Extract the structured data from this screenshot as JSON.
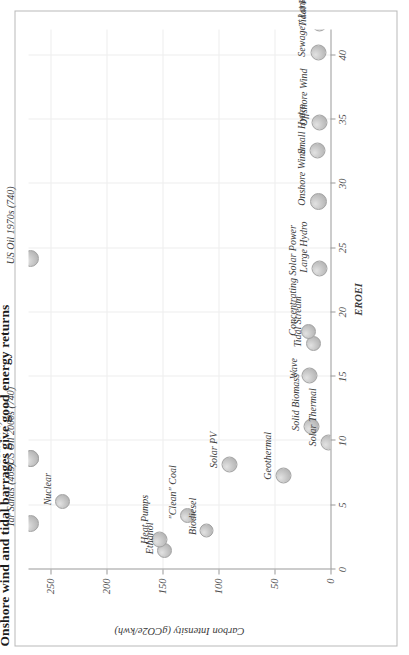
{
  "figure": {
    "title": "Onshore wind and tidal barrages give good energy returns"
  },
  "chart_data": {
    "type": "scatter",
    "title": "Onshore wind and tidal barrages give good energy returns",
    "xlabel": "EROEI",
    "ylabel": "Carbon Intensity (gCO2e/kwh)",
    "xlim": [
      0,
      42
    ],
    "ylim": [
      0,
      270
    ],
    "xticks": [
      0,
      5,
      10,
      15,
      20,
      25,
      30,
      35,
      40
    ],
    "xticklabels": [
      "0",
      "5",
      "10",
      "15",
      "20",
      "25",
      "30",
      "35",
      "40"
    ],
    "yticks": [
      0,
      50,
      100,
      150,
      200,
      250
    ],
    "yticklabels": [
      "0",
      "50",
      "100",
      "150",
      "200",
      "250"
    ],
    "grid": true,
    "legend": "none",
    "points": [
      {
        "label": "Tar Sands (465)",
        "x": 3.6,
        "y": 465,
        "y_clipped": 268,
        "size": 17,
        "label_dx": -4,
        "label_dy": -26,
        "label_rot": 0
      },
      {
        "label": "Coal (974)",
        "x": 8.6,
        "y": 974,
        "y_clipped": 268,
        "size": 17,
        "label_dx": -6,
        "label_dy": -40,
        "label_rot": 0
      },
      {
        "label": "US Oil 2000s (740)",
        "x": 8.6,
        "y": 740,
        "y_clipped": 268,
        "size": 17,
        "label_dx": -6,
        "label_dy": -26,
        "label_rot": 0
      },
      {
        "label": "US Oil 1970s (740)",
        "x": 24.2,
        "y": 740,
        "y_clipped": 268,
        "size": 17,
        "label_dx": -6,
        "label_dy": -26,
        "label_rot": 0
      },
      {
        "label": "Nuclear",
        "x": 5.3,
        "y": 240,
        "size": 15,
        "label_dx": -4,
        "label_dy": -21,
        "label_rot": 0
      },
      {
        "label": "Ethanol",
        "x": 1.5,
        "y": 148,
        "size": 15,
        "label_dx": -4,
        "label_dy": -21,
        "label_rot": 0
      },
      {
        "label": "Heat Pumps",
        "x": 2.3,
        "y": 153,
        "size": 16,
        "label_dx": -4,
        "label_dy": -21,
        "label_rot": 0
      },
      {
        "label": "\"Clean\" Coal",
        "x": 4.2,
        "y": 128,
        "size": 15,
        "label_dx": -4,
        "label_dy": -21,
        "label_rot": 0
      },
      {
        "label": "Biodiesel",
        "x": 3.0,
        "y": 111,
        "size": 14,
        "label_dx": -4,
        "label_dy": -20,
        "label_rot": 0
      },
      {
        "label": "Solar PV",
        "x": 8.2,
        "y": 90,
        "size": 16,
        "label_dx": -4,
        "label_dy": -22,
        "label_rot": 0
      },
      {
        "label": "Geothermal",
        "x": 7.3,
        "y": 42,
        "size": 16,
        "label_dx": -4,
        "label_dy": -22,
        "label_rot": 0
      },
      {
        "label": "Solid Biomass",
        "x": 11.1,
        "y": 17,
        "size": 16,
        "label_dx": -4,
        "label_dy": -22,
        "label_rot": 0
      },
      {
        "label": "Solar Thermal",
        "x": 9.9,
        "y": 2,
        "size": 16,
        "label_dx": -4,
        "label_dy": -22,
        "label_rot": 0
      },
      {
        "label": "Wave",
        "x": 15.1,
        "y": 19,
        "size": 16,
        "label_dx": -4,
        "label_dy": -22,
        "label_rot": 0
      },
      {
        "label": "Tidal Stream",
        "x": 17.6,
        "y": 15,
        "size": 15,
        "label_dx": -4,
        "label_dy": -22,
        "label_rot": 0
      },
      {
        "label": "Concentrating Solar Power",
        "x": 18.5,
        "y": 20,
        "size": 15,
        "label_dx": -4,
        "label_dy": -22,
        "label_rot": 0
      },
      {
        "label": "Large Hydro",
        "x": 23.4,
        "y": 10,
        "size": 16,
        "label_dx": -4,
        "label_dy": -22,
        "label_rot": 0
      },
      {
        "label": "Onshore Wind",
        "x": 28.6,
        "y": 11,
        "size": 17,
        "label_dx": -4,
        "label_dy": -23,
        "label_rot": 0
      },
      {
        "label": "Small Hydro",
        "x": 32.6,
        "y": 12,
        "size": 16,
        "label_dx": -4,
        "label_dy": -22,
        "label_rot": 0
      },
      {
        "label": "Offshore Wind",
        "x": 34.8,
        "y": 10,
        "size": 16,
        "label_dx": -4,
        "label_dy": -22,
        "label_rot": 0
      },
      {
        "label": "Sewage / Landfill Gas",
        "x": 40.2,
        "y": 11,
        "size": 16,
        "label_dx": -4,
        "label_dy": -23,
        "label_rot": 0
      },
      {
        "label": "Tidal Range (87)",
        "x": 42.5,
        "y": 10,
        "size": 16,
        "label_dx": -4,
        "label_dy": -23,
        "label_rot": 0
      }
    ]
  }
}
